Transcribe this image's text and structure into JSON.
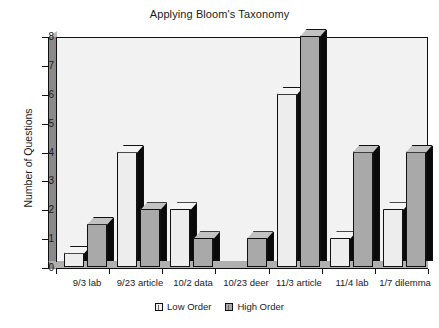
{
  "chart_data": {
    "type": "bar",
    "title": "Applying Bloom's Taxonomy",
    "xlabel": "",
    "ylabel": "Number of Questions",
    "ylim": [
      0,
      8
    ],
    "yticks": [
      "0",
      "1",
      "2",
      "3",
      "4",
      "5",
      "6",
      "7",
      "8"
    ],
    "grid": false,
    "legend_position": "bottom-center",
    "style": "3d-column",
    "categories": [
      "9/3 lab",
      "9/23 article",
      "10/2 data",
      "10/23 deer",
      "11/3 article",
      "11/4 lab",
      "1/7 dilemma"
    ],
    "series": [
      {
        "name": "Low Order",
        "color": "#ededed",
        "values": [
          0.5,
          4,
          2,
          0,
          6,
          1,
          2
        ]
      },
      {
        "name": "High Order",
        "color": "#a9a9a9",
        "values": [
          1.5,
          2,
          1,
          1,
          8,
          4,
          4
        ]
      }
    ]
  },
  "legend": {
    "items": [
      {
        "label": "Low Order"
      },
      {
        "label": "High Order"
      }
    ]
  }
}
